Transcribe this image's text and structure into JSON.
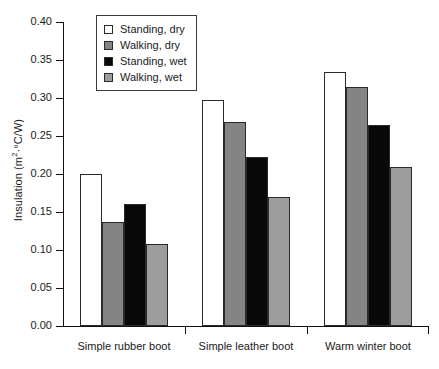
{
  "chart_data": {
    "type": "bar",
    "title": "",
    "xlabel": "",
    "ylabel": "Insulation (m2·°C/W)",
    "ylabel_parts": {
      "main": "Insulation (m",
      "sup": "2",
      "tail": "·°C/W)"
    },
    "categories": [
      "Simple rubber boot",
      "Simple leather boot",
      "Warm winter boot"
    ],
    "series": [
      {
        "name": "Standing, dry",
        "color": "#ffffff",
        "values": [
          0.2,
          0.297,
          0.334
        ]
      },
      {
        "name": "Walking, dry",
        "color": "#848484",
        "values": [
          0.137,
          0.268,
          0.314
        ]
      },
      {
        "name": "Standing, wet",
        "color": "#080808",
        "values": [
          0.161,
          0.222,
          0.264
        ]
      },
      {
        "name": "Walking, wet",
        "color": "#9d9d9d",
        "values": [
          0.108,
          0.17,
          0.209
        ]
      }
    ],
    "ylim": [
      0.0,
      0.4
    ],
    "yticks": [
      "0.00",
      "0.05",
      "0.10",
      "0.15",
      "0.20",
      "0.25",
      "0.30",
      "0.35",
      "0.40"
    ],
    "ytick_values": [
      0.0,
      0.05,
      0.1,
      0.15,
      0.2,
      0.25,
      0.3,
      0.35,
      0.4
    ],
    "grid": false,
    "legend_position": "top-left-inside"
  },
  "legend": {
    "items": [
      {
        "label": "Standing, dry",
        "color": "#ffffff"
      },
      {
        "label": "Walking, dry",
        "color": "#848484"
      },
      {
        "label": "Standing, wet",
        "color": "#080808"
      },
      {
        "label": "Walking, wet",
        "color": "#9d9d9d"
      }
    ]
  }
}
